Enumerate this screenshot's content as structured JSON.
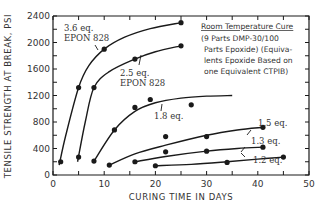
{
  "chart_data": {
    "type": "line",
    "title": "",
    "xlabel": "CURING TIME IN DAYS",
    "ylabel": "TENSILE STRENGTH AT BREAK, PSI",
    "xlim": [
      0,
      50
    ],
    "ylim": [
      0,
      2400
    ],
    "x_ticks": [
      0,
      10,
      20,
      30,
      40,
      50
    ],
    "y_ticks": [
      0,
      400,
      800,
      1200,
      1600,
      2000,
      2400
    ],
    "grid": false,
    "annotation": {
      "title": "Room Temperature Cure",
      "lines": [
        "(9 Parts DMP-30/100",
        "Parts Epoxide) (Equiva-",
        "lents Epoxide Based on",
        "one Equivalent CTPIB)"
      ]
    },
    "series": [
      {
        "name": "3.6 eq. EPON 828",
        "label_lines": [
          "3.6 eq.",
          "EPON 828"
        ],
        "points": [
          [
            1.5,
            200
          ],
          [
            5,
            1320
          ],
          [
            10,
            1900
          ],
          [
            25,
            2300
          ]
        ],
        "curve": [
          [
            1.2,
            150
          ],
          [
            2.5,
            600
          ],
          [
            5,
            1320
          ],
          [
            7,
            1650
          ],
          [
            10,
            1900
          ],
          [
            14,
            2080
          ],
          [
            19,
            2210
          ],
          [
            25,
            2300
          ]
        ]
      },
      {
        "name": "2.5 eq. EPON 828",
        "label_lines": [
          "2.5 eq.",
          "EPON 828"
        ],
        "points": [
          [
            5,
            270
          ],
          [
            8,
            1320
          ],
          [
            16,
            1750
          ],
          [
            25,
            1950
          ]
        ],
        "curve": [
          [
            4.8,
            200
          ],
          [
            6.3,
            800
          ],
          [
            8,
            1320
          ],
          [
            11,
            1560
          ],
          [
            16,
            1750
          ],
          [
            20,
            1860
          ],
          [
            25,
            1950
          ]
        ]
      },
      {
        "name": "1.8 eq.",
        "label_lines": [
          "1.8 eq."
        ],
        "points": [
          [
            8,
            210
          ],
          [
            12,
            680
          ],
          [
            16,
            1020
          ],
          [
            19,
            1140
          ],
          [
            27,
            1060
          ]
        ],
        "curve": [
          [
            8,
            210
          ],
          [
            12,
            680
          ],
          [
            16,
            960
          ],
          [
            20,
            1090
          ],
          [
            25,
            1160
          ],
          [
            30,
            1190
          ],
          [
            35,
            1200
          ]
        ]
      },
      {
        "name": "1.5 eq.",
        "label_lines": [
          "1.5 eq."
        ],
        "points": [
          [
            11,
            150
          ],
          [
            22,
            580
          ],
          [
            30,
            580
          ],
          [
            41,
            720
          ]
        ],
        "curve": [
          [
            11,
            150
          ],
          [
            16,
            320
          ],
          [
            22,
            450
          ],
          [
            30,
            600
          ],
          [
            36,
            680
          ],
          [
            41,
            720
          ]
        ]
      },
      {
        "name": "1.3 eq.",
        "label_lines": [
          "1.3 eq."
        ],
        "points": [
          [
            16,
            200
          ],
          [
            22,
            350
          ],
          [
            30,
            360
          ],
          [
            41,
            420
          ]
        ],
        "curve": [
          [
            16,
            200
          ],
          [
            22,
            280
          ],
          [
            30,
            360
          ],
          [
            36,
            400
          ],
          [
            41,
            420
          ]
        ]
      },
      {
        "name": "1.2 eq.",
        "label_lines": [
          "1.2 eq."
        ],
        "points": [
          [
            20,
            140
          ],
          [
            34,
            190
          ],
          [
            45,
            270
          ]
        ],
        "curve": [
          [
            20,
            140
          ],
          [
            27,
            160
          ],
          [
            34,
            200
          ],
          [
            40,
            240
          ],
          [
            45,
            270
          ]
        ]
      }
    ]
  }
}
